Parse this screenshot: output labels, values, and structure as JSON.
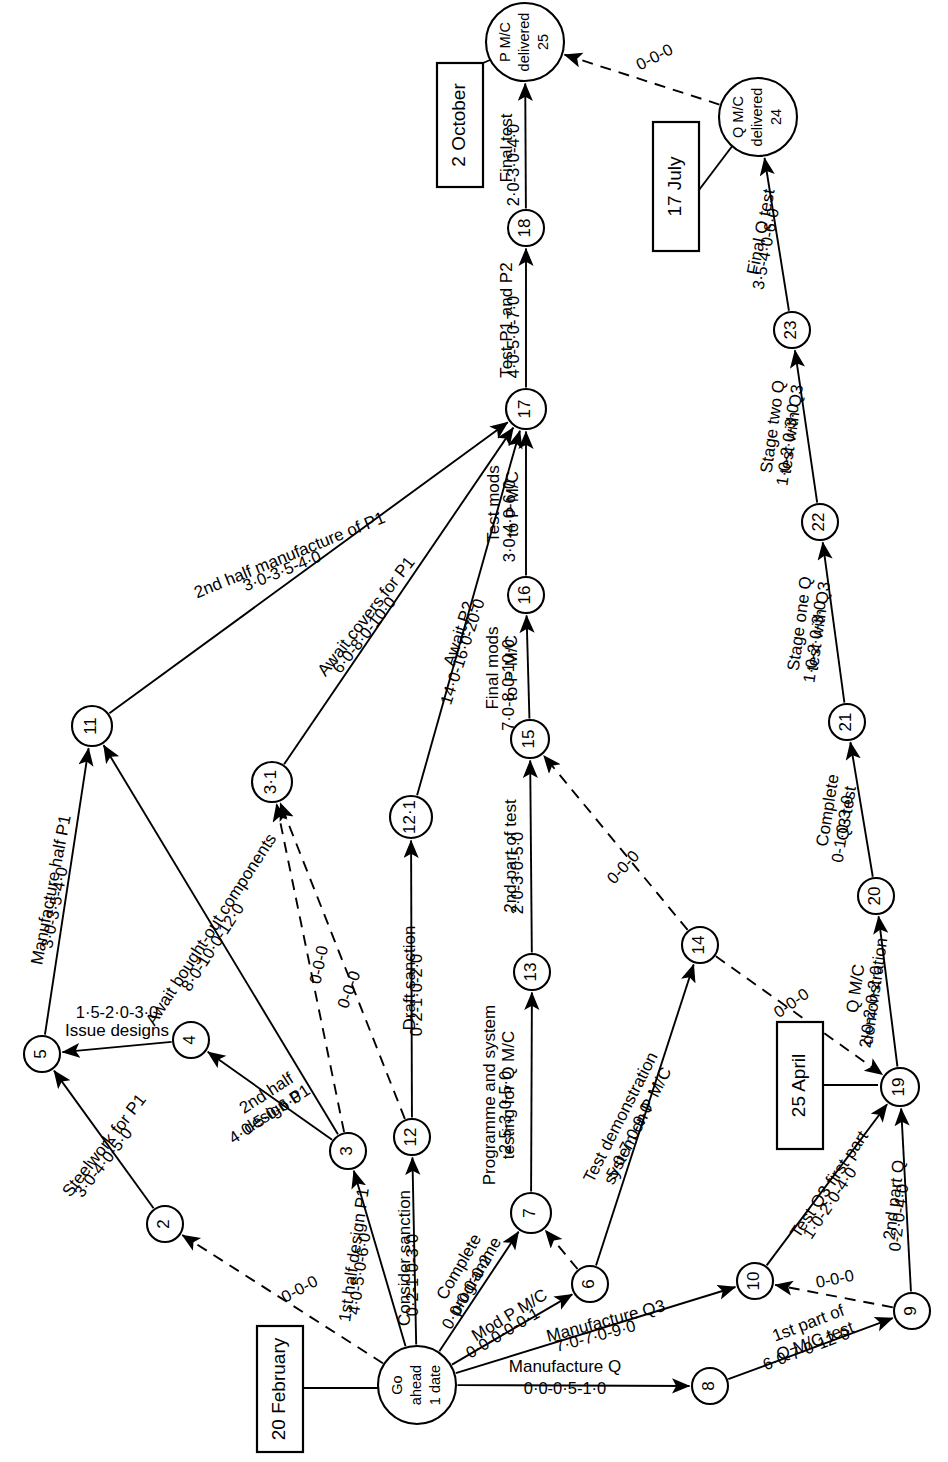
{
  "diagram": {
    "type": "pert-network",
    "orientation": "rotated-90-ccw"
  },
  "date_boxes": [
    {
      "id": "box-2-october",
      "label": "2 October",
      "x": 437,
      "y": 63,
      "w": 46,
      "h": 124,
      "anchor_x": 483,
      "anchor_y": 63,
      "to_x": 497,
      "to_y": 57
    },
    {
      "id": "box-17-july",
      "label": "17 July",
      "x": 653,
      "y": 122,
      "w": 46,
      "h": 129,
      "anchor_x": 699,
      "anchor_y": 190,
      "to_x": 733,
      "to_y": 145
    },
    {
      "id": "box-25-april",
      "label": "25 April",
      "x": 777,
      "y": 1022,
      "w": 46,
      "h": 127,
      "anchor_x": 823,
      "anchor_y": 1085,
      "to_x": 878,
      "to_y": 1085
    },
    {
      "id": "box-20-february",
      "label": "20 February",
      "x": 257,
      "y": 1326,
      "w": 46,
      "h": 126,
      "anchor_x": 303,
      "anchor_y": 1388,
      "to_x": 379,
      "to_y": 1388
    }
  ],
  "nodes": [
    {
      "id": "go",
      "label": "Go\nahead\n1 date",
      "x": 417,
      "y": 1385,
      "r": 39,
      "multiline": true
    },
    {
      "id": "2",
      "label": "2",
      "x": 165,
      "y": 1224,
      "r": 18
    },
    {
      "id": "3",
      "label": "3",
      "x": 348,
      "y": 1151,
      "r": 18
    },
    {
      "id": "3.1",
      "label": "3·1",
      "x": 272,
      "y": 782,
      "r": 20
    },
    {
      "id": "4",
      "label": "4",
      "x": 191,
      "y": 1040,
      "r": 18
    },
    {
      "id": "5",
      "label": "5",
      "x": 42,
      "y": 1054,
      "r": 18
    },
    {
      "id": "6",
      "label": "6",
      "x": 590,
      "y": 1284,
      "r": 18
    },
    {
      "id": "7",
      "label": "7",
      "x": 531,
      "y": 1213,
      "r": 20
    },
    {
      "id": "8",
      "label": "8",
      "x": 710,
      "y": 1386,
      "r": 18
    },
    {
      "id": "9",
      "label": "9",
      "x": 912,
      "y": 1311,
      "r": 18
    },
    {
      "id": "10",
      "label": "10",
      "x": 755,
      "y": 1281,
      "r": 18
    },
    {
      "id": "11",
      "label": "11",
      "x": 92,
      "y": 726,
      "r": 20
    },
    {
      "id": "12",
      "label": "12",
      "x": 412,
      "y": 1137,
      "r": 18
    },
    {
      "id": "12.1",
      "label": "12·1",
      "x": 411,
      "y": 817,
      "r": 21
    },
    {
      "id": "13",
      "label": "13",
      "x": 532,
      "y": 972,
      "r": 18
    },
    {
      "id": "14",
      "label": "14",
      "x": 700,
      "y": 945,
      "r": 18
    },
    {
      "id": "15",
      "label": "15",
      "x": 530,
      "y": 739,
      "r": 19
    },
    {
      "id": "16",
      "label": "16",
      "x": 526,
      "y": 595,
      "r": 18
    },
    {
      "id": "17",
      "label": "17",
      "x": 526,
      "y": 409,
      "r": 20
    },
    {
      "id": "18",
      "label": "18",
      "x": 526,
      "y": 228,
      "r": 18
    },
    {
      "id": "19",
      "label": "19",
      "x": 900,
      "y": 1087,
      "r": 19
    },
    {
      "id": "20",
      "label": "20",
      "x": 876,
      "y": 896,
      "r": 18
    },
    {
      "id": "21",
      "label": "21",
      "x": 847,
      "y": 722,
      "r": 18
    },
    {
      "id": "22",
      "label": "22",
      "x": 820,
      "y": 522,
      "r": 18
    },
    {
      "id": "23",
      "label": "23",
      "x": 792,
      "y": 330,
      "r": 18
    },
    {
      "id": "24",
      "label": "Q M/C\ndelivered\n24",
      "x": 758,
      "y": 117,
      "r": 39,
      "multiline": true
    },
    {
      "id": "25",
      "label": "P M/C\ndelivered\n25",
      "x": 525,
      "y": 42,
      "r": 39,
      "multiline": true
    }
  ],
  "edges": [
    {
      "from": "go",
      "to": "2",
      "style": "dashed",
      "activity": "",
      "duration": "0-0-0",
      "lx": 300,
      "ly": 1290,
      "dx": 0,
      "dy": 0,
      "rot": -28
    },
    {
      "from": "go",
      "to": "3",
      "style": "solid",
      "activity": "1st half design P1",
      "duration": "4·0-5·0-6·0",
      "lx": 355,
      "ly": 1255,
      "dx": -18,
      "dy": 8,
      "rot": -82
    },
    {
      "from": "go",
      "to": "12",
      "style": "solid",
      "activity": "Consider sanction",
      "duration": "0·2-1·0-3·0",
      "lx": 406,
      "ly": 1258,
      "dx": -17,
      "dy": 8,
      "rot": -90
    },
    {
      "from": "go",
      "to": "7",
      "style": "solid",
      "activity": "Complete\nprogramme",
      "duration": "0·0-0·0-0·2",
      "lx": 468,
      "ly": 1272,
      "dx": -18,
      "dy": 10,
      "rot": -60
    },
    {
      "from": "go",
      "to": "6",
      "style": "solid",
      "activity": "Mod P M/C",
      "duration": "0·0-0·0-0·1",
      "lx": 510,
      "ly": 1316,
      "dx": -15,
      "dy": 12,
      "rot": -31
    },
    {
      "from": "go",
      "to": "10",
      "style": "solid",
      "activity": "Manufacture Q3",
      "duration": "7·0-7·0-9·0",
      "lx": 606,
      "ly": 1322,
      "dx": -14,
      "dy": 12,
      "rot": -15
    },
    {
      "from": "go",
      "to": "8",
      "style": "solid",
      "activity": "Manufacture Q",
      "duration": "0·0-0·5-1·0",
      "lx": 565,
      "ly": 1368,
      "dx": 0,
      "dy": 22,
      "rot": 0
    },
    {
      "from": "2",
      "to": "5",
      "style": "solid",
      "activity": "Steelwork for P1",
      "duration": "3·0-4·0-5·0",
      "lx": 105,
      "ly": 1146,
      "dx": -14,
      "dy": 10,
      "rot": -52
    },
    {
      "from": "4",
      "to": "5",
      "style": "solid",
      "activity": "Issue designs",
      "duration": "1·5-2·0-3·0",
      "lx": 117,
      "ly": 1032,
      "dx": 0,
      "dy": -18,
      "rot": 0
    },
    {
      "from": "3",
      "to": "4",
      "style": "solid",
      "activity": "2nd half\ndesign P1",
      "duration": "4·0-5·0-6·0",
      "lx": 272,
      "ly": 1102,
      "dx": -14,
      "dy": 10,
      "rot": -33
    },
    {
      "from": "3",
      "to": "3.1",
      "style": "dashed",
      "activity": "",
      "duration": "0-0-0",
      "lx": 320,
      "ly": 965,
      "dx": 0,
      "dy": 0,
      "rot": -78
    },
    {
      "from": "12",
      "to": "3.1",
      "style": "dashed",
      "activity": "",
      "duration": "0-0-0",
      "lx": 350,
      "ly": 990,
      "dx": 0,
      "dy": 0,
      "rot": -70
    },
    {
      "from": "3",
      "to": "11",
      "style": "solid",
      "activity": "Await bought-out components",
      "duration": "8·0-10·0-12·0",
      "lx": 212,
      "ly": 930,
      "dx": -14,
      "dy": 11,
      "rot": -57
    },
    {
      "from": "5",
      "to": "11",
      "style": "solid",
      "activity": "Manufacture half P1",
      "duration": "3·0-3·5-4·0",
      "lx": 52,
      "ly": 890,
      "dx": -17,
      "dy": 7,
      "rot": -79
    },
    {
      "from": "11",
      "to": "17",
      "style": "solid",
      "activity": "2nd half manufacture of P1",
      "duration": "3·0-3·5-4·0",
      "lx": 290,
      "ly": 556,
      "dx": -13,
      "dy": 12,
      "rot": -22
    },
    {
      "from": "3.1",
      "to": "17",
      "style": "solid",
      "activity": "Await covers for P1",
      "duration": "6·0-8·0-10·0",
      "lx": 367,
      "ly": 617,
      "dx": -16,
      "dy": 10,
      "rot": -52
    },
    {
      "from": "12",
      "to": "12.1",
      "style": "solid",
      "activity": "Draft sanction",
      "duration": "0·2-1·0-2·0",
      "lx": 411,
      "ly": 978,
      "dx": -17,
      "dy": 7,
      "rot": -90
    },
    {
      "from": "12.1",
      "to": "17",
      "style": "solid",
      "activity": "Await P2",
      "duration": "14·0-16·0-20·0",
      "lx": 460,
      "ly": 634,
      "dx": -16,
      "dy": 9,
      "rot": -72
    },
    {
      "from": "7",
      "to": "13",
      "style": "solid",
      "activity": "Programme and system\ntesting for Q M/C",
      "duration": "2·5-3·0-5·0",
      "lx": 500,
      "ly": 1095,
      "dx": -17,
      "dy": 7,
      "rot": -90
    },
    {
      "from": "13",
      "to": "15",
      "style": "solid",
      "activity": "2nd part of test",
      "duration": "2·0-3·0-5·0",
      "lx": 512,
      "ly": 856,
      "dx": -17,
      "dy": 7,
      "rot": -90
    },
    {
      "from": "15",
      "to": "16",
      "style": "solid",
      "activity": "Final mods\nto P M/C",
      "duration": "7·0-8·0-10·0",
      "lx": 503,
      "ly": 668,
      "dx": -17,
      "dy": 7,
      "rot": -90
    },
    {
      "from": "16",
      "to": "17",
      "style": "solid",
      "activity": "Test mods\nto P M/C",
      "duration": "3·0-4·0-6·0",
      "lx": 504,
      "ly": 504,
      "dx": -17,
      "dy": 7,
      "rot": -90
    },
    {
      "from": "17",
      "to": "18",
      "style": "solid",
      "activity": "Test P1 and P2",
      "duration": "4·0-5·0-7·0",
      "lx": 508,
      "ly": 320,
      "dx": -17,
      "dy": 7,
      "rot": -90
    },
    {
      "from": "18",
      "to": "25",
      "style": "solid",
      "activity": "Final test",
      "duration": "2·0-3·0-4·0",
      "lx": 508,
      "ly": 148,
      "dx": -17,
      "dy": 7,
      "rot": -90
    },
    {
      "from": "6",
      "to": "7",
      "style": "dashed",
      "activity": "",
      "duration": "",
      "lx": 0,
      "ly": 0,
      "dx": 0,
      "dy": 0,
      "rot": 0
    },
    {
      "from": "6",
      "to": "14",
      "style": "solid",
      "activity": "Test demonstration\nsystem on P M/C",
      "duration": "5·0-7·0-9·0",
      "lx": 630,
      "ly": 1122,
      "dx": -17,
      "dy": 9,
      "rot": -63
    },
    {
      "from": "14",
      "to": "15",
      "style": "dashed",
      "activity": "",
      "duration": "0-0-0",
      "lx": 624,
      "ly": 868,
      "dx": 0,
      "dy": 0,
      "rot": -47
    },
    {
      "from": "14",
      "to": "19",
      "style": "dashed",
      "activity": "",
      "duration": "0-0-0",
      "lx": 792,
      "ly": 1004,
      "dx": 0,
      "dy": 0,
      "rot": -35
    },
    {
      "from": "8",
      "to": "9",
      "style": "solid",
      "activity": "1st part of\nQ M/C test",
      "duration": "6·0-7·0-12·0",
      "lx": 812,
      "ly": 1333,
      "dx": -11,
      "dy": 14,
      "rot": -21
    },
    {
      "from": "9",
      "to": "10",
      "style": "dashed",
      "activity": "",
      "duration": "0-0-0",
      "lx": 835,
      "ly": 1280,
      "dx": 0,
      "dy": 0,
      "rot": -11
    },
    {
      "from": "9",
      "to": "19",
      "style": "solid",
      "activity": "2nd part Q",
      "duration": "0-2·0-4·0",
      "lx": 895,
      "ly": 1200,
      "dx": -17,
      "dy": 7,
      "rot": -83
    },
    {
      "from": "10",
      "to": "19",
      "style": "solid",
      "activity": "Test Q3 first part",
      "duration": "1·0-2·0-4·0",
      "lx": 830,
      "ly": 1185,
      "dx": -15,
      "dy": 11,
      "rot": -56
    },
    {
      "from": "19",
      "to": "20",
      "style": "solid",
      "activity": "Q M/C\ndemonstration",
      "duration": "2·0-2·0-2·0",
      "lx": 866,
      "ly": 990,
      "dx": -16,
      "dy": 8,
      "rot": -82
    },
    {
      "from": "20",
      "to": "21",
      "style": "solid",
      "activity": "Complete\nQ3 test",
      "duration": "0-1·0-3·0",
      "lx": 838,
      "ly": 812,
      "dx": -16,
      "dy": 8,
      "rot": -81
    },
    {
      "from": "21",
      "to": "22",
      "style": "solid",
      "activity": "Stage one Q\ntest with Q3",
      "duration": "1·0-2·0-3·0",
      "lx": 810,
      "ly": 625,
      "dx": -16,
      "dy": 8,
      "rot": -82
    },
    {
      "from": "22",
      "to": "23",
      "style": "solid",
      "activity": "Stage two Q\ntest with Q3",
      "duration": "1·0-2·0-3·0",
      "lx": 783,
      "ly": 428,
      "dx": -16,
      "dy": 8,
      "rot": -82
    },
    {
      "from": "23",
      "to": "24",
      "style": "solid",
      "activity": "Final Q test",
      "duration": "3·5-4·0-6·0",
      "lx": 762,
      "ly": 232,
      "dx": -16,
      "dy": 8,
      "rot": -79
    },
    {
      "from": "24",
      "to": "25",
      "style": "dashed",
      "activity": "",
      "duration": "0-0-0",
      "lx": 655,
      "ly": 58,
      "dx": 0,
      "dy": 0,
      "rot": -27
    }
  ]
}
